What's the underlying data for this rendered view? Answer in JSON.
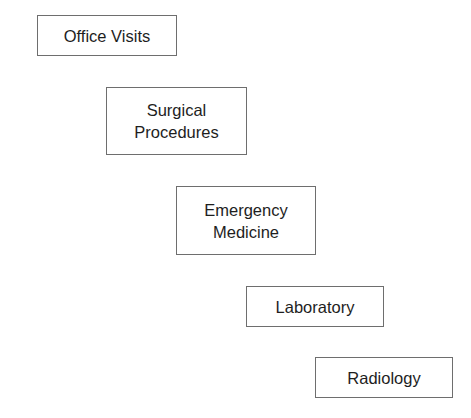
{
  "diagram": {
    "type": "staircase",
    "boxes": [
      {
        "label": "Office Visits"
      },
      {
        "label": "Surgical\nProcedures"
      },
      {
        "label": "Emergency\nMedicine"
      },
      {
        "label": "Laboratory"
      },
      {
        "label": "Radiology"
      }
    ],
    "colors": {
      "border": "#6e6e6e",
      "text": "#1e1e1e",
      "background": "#ffffff"
    }
  }
}
